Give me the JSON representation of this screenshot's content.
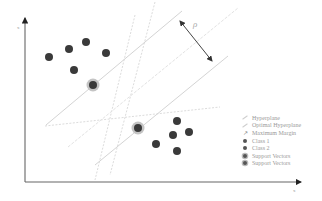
{
  "diagram": {
    "axes": {
      "x_label": "x",
      "y_label": "x"
    },
    "margin_label": "ρ",
    "class1_points": [
      [
        49,
        57
      ],
      [
        69,
        49
      ],
      [
        86,
        42
      ],
      [
        106,
        53
      ],
      [
        74,
        70
      ]
    ],
    "class2_points": [
      [
        177,
        121
      ],
      [
        173,
        135
      ],
      [
        189,
        132
      ],
      [
        156,
        144
      ],
      [
        177,
        151
      ]
    ],
    "support_vectors": [
      [
        93,
        85
      ],
      [
        138,
        128
      ]
    ],
    "colors": {
      "point": "#3a3a3a",
      "support_ring": "#b8b8b8",
      "line": "#d6d6d6",
      "dotted": "#dedede",
      "axis": "#6a6a6a",
      "arrow": "#333333"
    }
  },
  "legend": {
    "items": [
      {
        "symbol": "line",
        "label": "Hyperplane"
      },
      {
        "symbol": "line",
        "label": "Optimal Hyperplane"
      },
      {
        "symbol": "arrow",
        "label": "Maximum Margin"
      },
      {
        "symbol": "dot",
        "label": "Class 1"
      },
      {
        "symbol": "dot",
        "label": "Class 2"
      },
      {
        "symbol": "sv",
        "label": "Support Vectors"
      },
      {
        "symbol": "sv",
        "label": "Support Vectors"
      }
    ]
  }
}
